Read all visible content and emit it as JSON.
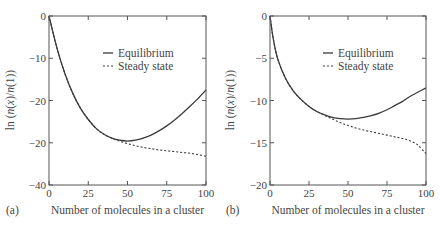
{
  "chart_data": [
    {
      "type": "line",
      "panel_label": "(a)",
      "title": "",
      "xlabel": "Number of molecules in a cluster",
      "ylabel": "ln (n(x)/n(1))",
      "xlim": [
        0,
        100
      ],
      "ylim": [
        -40,
        0
      ],
      "xticks": [
        0,
        25,
        50,
        75,
        100
      ],
      "xtick_labels": [
        "0",
        "25",
        "50",
        "75",
        "100"
      ],
      "yticks": [
        0,
        -10,
        -20,
        -30,
        -40
      ],
      "ytick_labels": [
        "0",
        "−10",
        "−20",
        "−20",
        "−40"
      ],
      "grid": false,
      "legend_position": "upper right inside",
      "legend": [
        "Equilibrium",
        "Steady state"
      ],
      "series": [
        {
          "name": "Equilibrium",
          "style": "solid",
          "x": [
            0,
            5,
            10,
            15,
            20,
            25,
            30,
            35,
            40,
            45,
            50,
            55,
            60,
            65,
            70,
            75,
            80,
            85,
            90,
            95,
            100
          ],
          "y": [
            0,
            -7.5,
            -13.5,
            -18.2,
            -21.8,
            -24.5,
            -26.6,
            -28.0,
            -28.9,
            -29.4,
            -29.6,
            -29.4,
            -28.9,
            -28.2,
            -27.2,
            -26.0,
            -24.6,
            -23.0,
            -21.3,
            -19.5,
            -17.5
          ]
        },
        {
          "name": "Steady state",
          "style": "dashed",
          "x": [
            0,
            5,
            10,
            15,
            20,
            25,
            30,
            35,
            40,
            45,
            50,
            55,
            60,
            65,
            70,
            75,
            80,
            85,
            90,
            95,
            100
          ],
          "y": [
            0,
            -7.5,
            -13.5,
            -18.2,
            -21.8,
            -24.5,
            -26.6,
            -28.0,
            -28.9,
            -29.6,
            -30.2,
            -30.7,
            -31.1,
            -31.4,
            -31.7,
            -31.9,
            -32.1,
            -32.3,
            -32.5,
            -32.8,
            -33.2
          ]
        }
      ]
    },
    {
      "type": "line",
      "panel_label": "(b)",
      "title": "",
      "xlabel": "Number of molecules in a cluster",
      "ylabel": "ln (n(x)/n(1))",
      "xlim": [
        0,
        100
      ],
      "ylim": [
        -20,
        0
      ],
      "xticks": [
        0,
        25,
        50,
        75,
        100
      ],
      "xtick_labels": [
        "0",
        "25",
        "50",
        "75",
        "100"
      ],
      "yticks": [
        0,
        -5,
        -10,
        -15,
        -20
      ],
      "ytick_labels": [
        "0",
        "−5",
        "−10",
        "−15",
        "−20"
      ],
      "grid": false,
      "legend_position": "upper right inside",
      "legend": [
        "Equilibrium",
        "Steady state"
      ],
      "series": [
        {
          "name": "Equilibrium",
          "style": "solid",
          "x": [
            0,
            2,
            5,
            10,
            15,
            20,
            25,
            30,
            35,
            40,
            45,
            50,
            55,
            60,
            65,
            70,
            75,
            80,
            85,
            90,
            95,
            100
          ],
          "y": [
            0,
            -2.6,
            -5.1,
            -7.4,
            -8.9,
            -9.9,
            -10.7,
            -11.3,
            -11.7,
            -12.0,
            -12.15,
            -12.2,
            -12.15,
            -12.0,
            -11.8,
            -11.5,
            -11.1,
            -10.6,
            -10.1,
            -9.5,
            -9.0,
            -8.5
          ]
        },
        {
          "name": "Steady state",
          "style": "dashed",
          "x": [
            0,
            2,
            5,
            10,
            15,
            20,
            25,
            30,
            35,
            40,
            45,
            50,
            55,
            60,
            65,
            70,
            75,
            80,
            85,
            90,
            95,
            100
          ],
          "y": [
            0,
            -2.6,
            -5.1,
            -7.4,
            -8.9,
            -9.9,
            -10.7,
            -11.3,
            -11.75,
            -12.2,
            -12.6,
            -12.95,
            -13.25,
            -13.5,
            -13.7,
            -13.9,
            -14.1,
            -14.3,
            -14.5,
            -14.8,
            -15.3,
            -16.3
          ]
        }
      ]
    }
  ],
  "panels": [
    {
      "label": "(a)",
      "xlabel": "Number of molecules in a cluster",
      "ylabel_prefix": "ln (",
      "ylabel_n1": "n",
      "ylabel_x": "x",
      "ylabel_mid": ")/",
      "ylabel_n2": "n",
      "ylabel_suffix": "(1))",
      "legend": {
        "equilibrium": "Equilibrium",
        "steady": "Steady state"
      }
    },
    {
      "label": "(b)",
      "xlabel": "Number of molecules in a cluster",
      "ylabel_prefix": "ln (",
      "ylabel_n1": "n",
      "ylabel_x": "x",
      "ylabel_mid": ")/",
      "ylabel_n2": "n",
      "ylabel_suffix": "(1))",
      "legend": {
        "equilibrium": "Equilibrium",
        "steady": "Steady state"
      }
    }
  ],
  "colors": {
    "line": "#3a3a3a",
    "axis": "#555555"
  }
}
